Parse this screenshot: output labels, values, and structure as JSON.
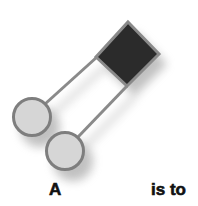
{
  "diagram": {
    "labels": {
      "left": "A",
      "right": "is to"
    },
    "shapes": {
      "square": {
        "kind": "rotated-square",
        "fill": "#2b2b2b",
        "stroke": "#8a8a8a"
      },
      "circles": [
        {
          "kind": "circle",
          "fill": "#d6d6d6",
          "stroke": "#7e7e7e"
        },
        {
          "kind": "circle",
          "fill": "#d6d6d6",
          "stroke": "#7e7e7e"
        }
      ],
      "connectors": {
        "stroke": "#8a8a8a"
      },
      "shadow_color": "#9a9a9a"
    }
  }
}
